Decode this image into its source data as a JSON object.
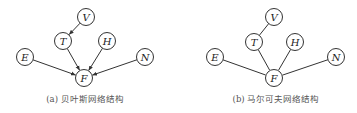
{
  "panels": [
    {
      "id": "a",
      "caption": "(a) 贝叶斯网络结构",
      "type": "directed",
      "caption_x": 85,
      "nodes": [
        {
          "id": "V",
          "label": "V",
          "x": 86,
          "y": 17
        },
        {
          "id": "T",
          "label": "T",
          "x": 63,
          "y": 41
        },
        {
          "id": "H",
          "label": "H",
          "x": 107,
          "y": 41
        },
        {
          "id": "E",
          "label": "E",
          "x": 25,
          "y": 57
        },
        {
          "id": "N",
          "label": "N",
          "x": 145,
          "y": 57
        },
        {
          "id": "F",
          "label": "F",
          "x": 84,
          "y": 78
        }
      ],
      "edges": [
        {
          "from": "V",
          "to": "T"
        },
        {
          "from": "T",
          "to": "F"
        },
        {
          "from": "H",
          "to": "F"
        },
        {
          "from": "E",
          "to": "F"
        },
        {
          "from": "N",
          "to": "F"
        }
      ]
    },
    {
      "id": "b",
      "caption": "(b) 马尔可夫网络结构",
      "type": "undirected",
      "caption_x": 276,
      "nodes": [
        {
          "id": "V",
          "label": "V",
          "x": 274,
          "y": 17
        },
        {
          "id": "T",
          "label": "T",
          "x": 254,
          "y": 42
        },
        {
          "id": "H",
          "label": "H",
          "x": 295,
          "y": 42
        },
        {
          "id": "E",
          "label": "E",
          "x": 215,
          "y": 57
        },
        {
          "id": "N",
          "label": "N",
          "x": 336,
          "y": 57
        },
        {
          "id": "F",
          "label": "F",
          "x": 274,
          "y": 78
        }
      ],
      "edges": [
        {
          "from": "V",
          "to": "T"
        },
        {
          "from": "T",
          "to": "F"
        },
        {
          "from": "H",
          "to": "F"
        },
        {
          "from": "E",
          "to": "F"
        },
        {
          "from": "N",
          "to": "F"
        }
      ]
    }
  ],
  "style": {
    "node_radius": 8.5,
    "stroke_color": "#333333",
    "caption_color": "#555555"
  }
}
